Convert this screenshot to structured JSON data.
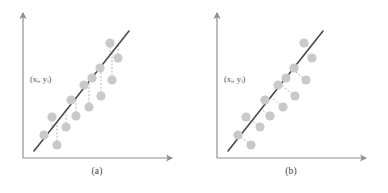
{
  "figure": {
    "background": "#ffffff",
    "point_color": "#c9c9c9",
    "line_color": "#4a4a4a",
    "axis_color": "#8e8e8e",
    "connector_color": "#b5b5b5",
    "label_color": "#555555"
  },
  "panels": [
    {
      "id": "a",
      "caption": "(a)",
      "point_label": "(xᵢ,  yᵢ)",
      "point_label_x": 30,
      "point_label_y": 82,
      "residual_mode": "vertical",
      "axes": {
        "origin_x": 23,
        "origin_y": 158,
        "y_top": 13,
        "x_right": 172
      },
      "fit_line": {
        "x1": 34,
        "y1": 151,
        "x2": 129,
        "y2": 31
      },
      "points": [
        {
          "x": 44,
          "y": 135
        },
        {
          "x": 57,
          "y": 145
        },
        {
          "x": 52,
          "y": 117
        },
        {
          "x": 66,
          "y": 127
        },
        {
          "x": 71,
          "y": 100
        },
        {
          "x": 76,
          "y": 116
        },
        {
          "x": 84,
          "y": 85
        },
        {
          "x": 89,
          "y": 107
        },
        {
          "x": 92,
          "y": 78
        },
        {
          "x": 101,
          "y": 96
        },
        {
          "x": 100,
          "y": 68
        },
        {
          "x": 112,
          "y": 80
        },
        {
          "x": 110,
          "y": 43
        },
        {
          "x": 118,
          "y": 58
        }
      ]
    },
    {
      "id": "b",
      "caption": "(b)",
      "point_label": "(xᵢ,  yᵢ)",
      "point_label_x": 30,
      "point_label_y": 82,
      "residual_mode": "perpendicular",
      "axes": {
        "origin_x": 23,
        "origin_y": 158,
        "y_top": 13,
        "x_right": 172
      },
      "fit_line": {
        "x1": 34,
        "y1": 151,
        "x2": 129,
        "y2": 31
      },
      "points": [
        {
          "x": 44,
          "y": 135
        },
        {
          "x": 57,
          "y": 145
        },
        {
          "x": 52,
          "y": 117
        },
        {
          "x": 66,
          "y": 127
        },
        {
          "x": 71,
          "y": 100
        },
        {
          "x": 76,
          "y": 116
        },
        {
          "x": 84,
          "y": 85
        },
        {
          "x": 89,
          "y": 107
        },
        {
          "x": 92,
          "y": 78
        },
        {
          "x": 101,
          "y": 96
        },
        {
          "x": 100,
          "y": 68
        },
        {
          "x": 112,
          "y": 80
        },
        {
          "x": 110,
          "y": 43
        },
        {
          "x": 118,
          "y": 58
        }
      ]
    }
  ]
}
